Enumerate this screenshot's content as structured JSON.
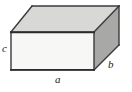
{
  "figure": {
    "kind": "3d-rectangular-box",
    "canvas": {
      "width": 132,
      "height": 92
    },
    "background_color": "#ffffff"
  },
  "colors": {
    "front_face": "#f7f7f5",
    "top_face": "#d8d8d6",
    "right_face": "#a8a8a6",
    "edge_stroke": "#3a3a3a",
    "shadow_edge": "#2b2b2b",
    "label_text": "#1a1a1a"
  },
  "faces": [
    {
      "name": "front-face",
      "points": "11,32 94,32 94,70 11,70",
      "fill": "#f7f7f5"
    },
    {
      "name": "top-face",
      "points": "11,32 32,6 119,6 94,32",
      "fill": "#d8d8d6"
    },
    {
      "name": "right-face",
      "points": "94,32 119,6 119,45 94,70",
      "fill": "#a8a8a6"
    }
  ],
  "edges": [
    {
      "name": "front-top-edge",
      "x1": 11,
      "y1": 32,
      "x2": 94,
      "y2": 32
    },
    {
      "name": "front-bottom-edge",
      "x1": 11,
      "y1": 70,
      "x2": 94,
      "y2": 70
    },
    {
      "name": "front-left-edge",
      "x1": 11,
      "y1": 32,
      "x2": 11,
      "y2": 70
    },
    {
      "name": "front-right-edge",
      "x1": 94,
      "y1": 32,
      "x2": 94,
      "y2": 70
    },
    {
      "name": "top-back-edge",
      "x1": 32,
      "y1": 6,
      "x2": 119,
      "y2": 6
    },
    {
      "name": "top-left-edge",
      "x1": 11,
      "y1": 32,
      "x2": 32,
      "y2": 6
    },
    {
      "name": "top-right-edge",
      "x1": 94,
      "y1": 32,
      "x2": 119,
      "y2": 6
    },
    {
      "name": "back-right-edge",
      "x1": 119,
      "y1": 6,
      "x2": 119,
      "y2": 45
    },
    {
      "name": "bottom-right-edge",
      "x1": 94,
      "y1": 70,
      "x2": 119,
      "y2": 45
    }
  ],
  "labels": {
    "depth_left": "c",
    "width_bottom": "a",
    "depth_right": "b"
  }
}
